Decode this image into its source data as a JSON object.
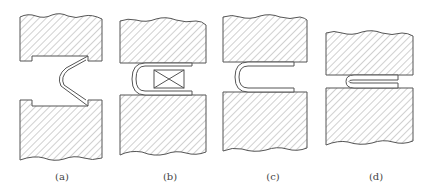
{
  "figure": {
    "colors": {
      "stroke": "#555555",
      "hatch": "#8a8a8a",
      "background": "#ffffff"
    },
    "panels": [
      {
        "id": "a",
        "label": "(a)",
        "label_x": 62,
        "stage": "v-bend"
      },
      {
        "id": "b",
        "label": "(b)",
        "label_x": 170,
        "stage": "insert-bend"
      },
      {
        "id": "c",
        "label": "(c)",
        "label_x": 273,
        "stage": "u-bend"
      },
      {
        "id": "d",
        "label": "(d)",
        "label_x": 376,
        "stage": "flatten"
      }
    ]
  }
}
